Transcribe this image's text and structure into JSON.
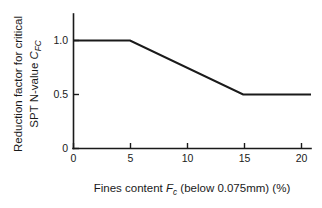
{
  "chart_data": {
    "type": "line",
    "title": "",
    "xlabel_parts": {
      "prefix": "Fines content ",
      "symbol": "F",
      "symbol_sub": "c",
      "suffix": " (below 0.075mm) (%)"
    },
    "xlabel": "Fines content Fc (below 0.075mm) (%)",
    "ylabel_line1": "Reduction factor for critical",
    "ylabel_line2_prefix": "SPT N-value ",
    "ylabel_line2_symbol": "C",
    "ylabel_line2_sub": "FC",
    "ylabel": "Reduction factor for critical SPT N-value CFC",
    "x": [
      0,
      5,
      15,
      21
    ],
    "values": [
      1.0,
      1.0,
      0.5,
      0.5
    ],
    "series": [
      {
        "name": "Reduction factor CFC",
        "points": [
          {
            "x": 0,
            "y": 1.0
          },
          {
            "x": 5,
            "y": 1.0
          },
          {
            "x": 15,
            "y": 0.5
          },
          {
            "x": 21,
            "y": 0.5
          }
        ]
      }
    ],
    "xticks": [
      0,
      5,
      10,
      15,
      20
    ],
    "xtick_labels": [
      "0",
      "5",
      "10",
      "15",
      "20"
    ],
    "yticks": [
      0,
      0.5,
      1.0
    ],
    "ytick_labels": [
      "0",
      "0.5",
      "1.0"
    ],
    "xlim": [
      0,
      21
    ],
    "ylim": [
      0,
      1.2
    ],
    "grid": false,
    "legend": "none",
    "line_color": "#1a1a1a",
    "axis_color": "#1a1a1a",
    "background": "#ffffff"
  }
}
